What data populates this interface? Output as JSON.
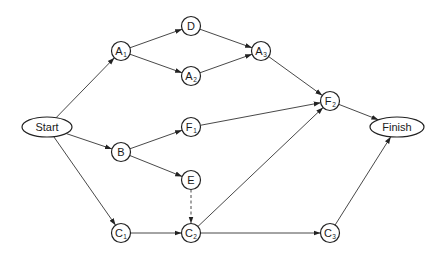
{
  "diagram": {
    "type": "activity-network",
    "nodes": [
      {
        "id": "start",
        "label": "Start",
        "sub": "",
        "shape": "ellipse",
        "x": 47,
        "y": 127,
        "rx": 25,
        "ry": 10
      },
      {
        "id": "A1",
        "label": "A",
        "sub": "1",
        "shape": "circle",
        "x": 121,
        "y": 51,
        "r": 9.5
      },
      {
        "id": "D",
        "label": "D",
        "sub": "",
        "shape": "circle",
        "x": 191,
        "y": 26,
        "r": 9.5
      },
      {
        "id": "A2",
        "label": "A",
        "sub": "2",
        "shape": "circle",
        "x": 191,
        "y": 76,
        "r": 9.5
      },
      {
        "id": "A3",
        "label": "A",
        "sub": "3",
        "shape": "circle",
        "x": 261,
        "y": 51,
        "r": 9.5
      },
      {
        "id": "F2",
        "label": "F",
        "sub": "2",
        "shape": "circle",
        "x": 330,
        "y": 101,
        "r": 9.5
      },
      {
        "id": "finish",
        "label": "Finish",
        "sub": "",
        "shape": "ellipse",
        "x": 397,
        "y": 127,
        "rx": 27,
        "ry": 10
      },
      {
        "id": "B",
        "label": "B",
        "sub": "",
        "shape": "circle",
        "x": 121,
        "y": 152,
        "r": 9.5
      },
      {
        "id": "F1",
        "label": "F",
        "sub": "1",
        "shape": "circle",
        "x": 191,
        "y": 127,
        "r": 9.5
      },
      {
        "id": "E",
        "label": "E",
        "sub": "",
        "shape": "circle",
        "x": 191,
        "y": 180,
        "r": 9.5
      },
      {
        "id": "C1",
        "label": "C",
        "sub": "1",
        "shape": "circle",
        "x": 121,
        "y": 233,
        "r": 9.5
      },
      {
        "id": "C2",
        "label": "C",
        "sub": "2",
        "shape": "circle",
        "x": 191,
        "y": 233,
        "r": 9.5
      },
      {
        "id": "C3",
        "label": "C",
        "sub": "3",
        "shape": "circle",
        "x": 330,
        "y": 233,
        "r": 9.5
      }
    ],
    "edges": [
      {
        "from": "start",
        "to": "A1",
        "style": "solid"
      },
      {
        "from": "start",
        "to": "B",
        "style": "solid"
      },
      {
        "from": "start",
        "to": "C1",
        "style": "solid"
      },
      {
        "from": "A1",
        "to": "D",
        "style": "solid"
      },
      {
        "from": "A1",
        "to": "A2",
        "style": "solid"
      },
      {
        "from": "D",
        "to": "A3",
        "style": "solid"
      },
      {
        "from": "A2",
        "to": "A3",
        "style": "solid"
      },
      {
        "from": "A3",
        "to": "F2",
        "style": "solid"
      },
      {
        "from": "B",
        "to": "F1",
        "style": "solid"
      },
      {
        "from": "B",
        "to": "E",
        "style": "solid"
      },
      {
        "from": "F1",
        "to": "F2",
        "style": "solid"
      },
      {
        "from": "E",
        "to": "C2",
        "style": "dashed"
      },
      {
        "from": "C1",
        "to": "C2",
        "style": "solid"
      },
      {
        "from": "C2",
        "to": "F2",
        "style": "solid"
      },
      {
        "from": "C2",
        "to": "C3",
        "style": "solid"
      },
      {
        "from": "F2",
        "to": "finish",
        "style": "solid"
      },
      {
        "from": "C3",
        "to": "finish",
        "style": "solid"
      }
    ],
    "colors": {
      "background": "#ffffff",
      "stroke": "#222222",
      "text": "#1a1a1a"
    }
  }
}
